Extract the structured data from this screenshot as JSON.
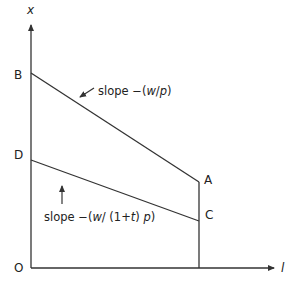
{
  "diagram": {
    "axes": {
      "y_label": "x",
      "x_label": "l",
      "origin_label": "O"
    },
    "points": {
      "B": "B",
      "D": "D",
      "A": "A",
      "C": "C"
    },
    "annotations": {
      "upper_slope_prefix": "slope −(",
      "upper_slope_w": "w",
      "upper_slope_slash": "/",
      "upper_slope_p": "p",
      "upper_slope_close": ")",
      "lower_slope_prefix": "slope −(",
      "lower_slope_w": "w",
      "lower_slope_mid": "/ (1+",
      "lower_slope_t": "t",
      "lower_slope_close1": ") ",
      "lower_slope_p": "p",
      "lower_slope_close2": ")"
    },
    "colors": {
      "line": "#333333",
      "background": "#ffffff"
    }
  }
}
